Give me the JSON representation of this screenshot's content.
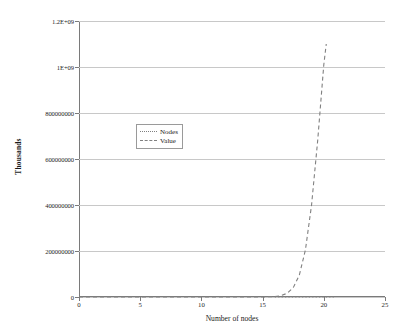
{
  "chart_data": {
    "type": "line",
    "title": "",
    "xlabel": "Number of nodes",
    "ylabel": "Thousands",
    "xlim": [
      0,
      25
    ],
    "ylim": [
      0,
      1200000000
    ],
    "grid": "horizontal",
    "legend_position": "upper-center-left",
    "x_ticks": [
      "0",
      "5",
      "10",
      "15",
      "20",
      "25"
    ],
    "x_tick_values": [
      0,
      5,
      10,
      15,
      20,
      25
    ],
    "y_ticks": [
      "0",
      "200000000",
      "400000000",
      "600000000",
      "800000000",
      "1E+09",
      "1.2E+09"
    ],
    "y_tick_values": [
      0,
      200000000,
      400000000,
      600000000,
      800000000,
      1000000000,
      1200000000
    ],
    "series": [
      {
        "name": "Nodes",
        "style": "dotted",
        "color": "#808080",
        "x": [
          16,
          16.25,
          16.5,
          16.75,
          17,
          17.25,
          17.5,
          17.75,
          18,
          18.25,
          18.5,
          18.75,
          19,
          19.25,
          19.5,
          19.75,
          20,
          20.25,
          20.5,
          20.75,
          21
        ],
        "values": [
          0,
          0,
          0,
          0,
          0,
          0,
          0,
          0,
          0,
          0,
          0,
          0,
          0,
          0,
          0,
          0,
          0,
          0,
          0,
          0,
          0
        ]
      },
      {
        "name": "Value",
        "style": "dashed",
        "color": "#808080",
        "x": [
          0,
          2,
          4,
          6,
          8,
          10,
          12,
          14,
          15,
          16,
          16.5,
          17,
          17.5,
          18,
          18.5,
          19,
          19.5,
          20,
          20.2
        ],
        "values": [
          0,
          0,
          0,
          0,
          0,
          0,
          0,
          0,
          0,
          2000000,
          6000000,
          16000000,
          40000000,
          95000000,
          205000000,
          400000000,
          680000000,
          1010000000,
          1100000000
        ]
      }
    ]
  },
  "legend": {
    "items": [
      {
        "label": "Nodes",
        "style": "dotted"
      },
      {
        "label": "Value",
        "style": "dashed"
      }
    ]
  }
}
